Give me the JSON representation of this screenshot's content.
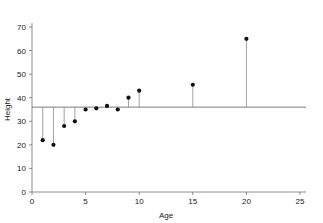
{
  "chart_data": {
    "type": "scatter",
    "title": "",
    "xlabel": "Age",
    "ylabel": "Height",
    "xlim": [
      0,
      25
    ],
    "ylim": [
      0,
      70
    ],
    "xticks": [
      0,
      5,
      10,
      15,
      20,
      25
    ],
    "yticks": [
      0,
      10,
      20,
      30,
      40,
      50,
      60,
      70
    ],
    "grid": false,
    "legend": null,
    "reference_line": {
      "orientation": "horizontal",
      "value": 36,
      "label": ""
    },
    "stems": {
      "enabled": true,
      "baseline": 36
    },
    "x": [
      1,
      2,
      3,
      4,
      5,
      6,
      7,
      8,
      9,
      10,
      15,
      20
    ],
    "y": [
      22,
      20,
      28,
      30,
      35,
      35.5,
      36.5,
      35,
      40,
      43,
      45.5,
      65
    ],
    "series": [
      {
        "name": "Height vs Age",
        "marker": "circle",
        "color": "#111111",
        "points": [
          {
            "x": 1,
            "y": 22
          },
          {
            "x": 2,
            "y": 20
          },
          {
            "x": 3,
            "y": 28
          },
          {
            "x": 4,
            "y": 30
          },
          {
            "x": 5,
            "y": 35
          },
          {
            "x": 6,
            "y": 35.5
          },
          {
            "x": 7,
            "y": 36.5
          },
          {
            "x": 8,
            "y": 35
          },
          {
            "x": 9,
            "y": 40
          },
          {
            "x": 10,
            "y": 43
          },
          {
            "x": 15,
            "y": 45.5
          },
          {
            "x": 20,
            "y": 65
          }
        ]
      }
    ]
  },
  "axis": {
    "x_title": "Age",
    "y_title": "Height",
    "x_tick_labels": [
      "0",
      "5",
      "10",
      "15",
      "20",
      "25"
    ],
    "y_tick_labels": [
      "0",
      "10",
      "20",
      "30",
      "40",
      "50",
      "60",
      "70"
    ]
  },
  "colors": {
    "background": "#ffffff",
    "marker": "#111111",
    "stem": "#8a8a8a",
    "axis": "#6e6e6e",
    "reference_line": "#6e6e6e",
    "text": "#1a1a1a"
  }
}
